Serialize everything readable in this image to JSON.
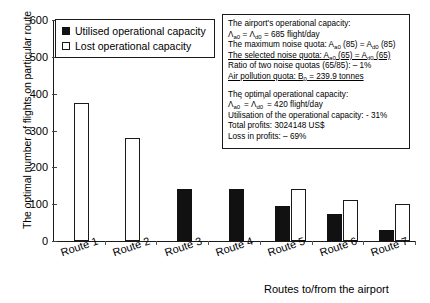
{
  "chart_data": {
    "type": "bar",
    "title": "",
    "xlabel": "Routes to/from the airport",
    "ylabel": "The optimal number of flights on particular route",
    "ylim": [
      0,
      600
    ],
    "yticks": [
      0,
      100,
      200,
      300,
      400,
      500,
      600
    ],
    "grid": false,
    "legend_position": "top-left",
    "categories": [
      "Route 1",
      "Route 2",
      "Route 3",
      "Route 4",
      "Route 5",
      "Route 6",
      "Route 7"
    ],
    "series": [
      {
        "name": "Utilised operational capacity",
        "color": "#111111",
        "values": [
          0,
          0,
          140,
          140,
          95,
          72,
          30
        ]
      },
      {
        "name": "Lost operational capacity",
        "color": "#ffffff",
        "values": [
          375,
          280,
          0,
          0,
          142,
          112,
          100
        ]
      }
    ]
  },
  "legend": {
    "items": [
      {
        "label": "Utilised operational capacity",
        "style": "filled"
      },
      {
        "label": "Lost operational capacity",
        "style": "hollow"
      }
    ]
  },
  "axes": {
    "y_title": "The optimal number of flights on particular route",
    "x_title": "Routes to/from the airport",
    "y_tick_labels": [
      "600",
      "500",
      "400",
      "300",
      "200",
      "100",
      "0"
    ],
    "x_tick_labels": [
      "Route 1",
      "Route 2",
      "Route 3",
      "Route 4",
      "Route 5",
      "Route 6",
      "Route 7"
    ]
  },
  "annotation": {
    "block1": [
      {
        "text": "The airport's operational capacity:",
        "underline": false
      },
      {
        "text": "Λa0 = Λd0 = 685 flight/day",
        "underline": false
      },
      {
        "text": "The maximum noise quota: Aa0 (85) = Ad0 (85)",
        "underline": false
      },
      {
        "text": "The selected noise quota: Aa0 (65) = Ad0 (65)",
        "underline": true
      },
      {
        "text": "Ratio of two noise quotas (65/85): – 1%",
        "underline": false
      },
      {
        "text": "Air pollution quota: B0 = 239.9 tonnes",
        "underline": true
      }
    ],
    "block2": [
      {
        "text": "The optimal operational capacity:",
        "underline": false
      },
      {
        "text": "Λa0' = Λd0' = 420 flight/day",
        "underline": false
      },
      {
        "text": "Utilisation of the operational capacity: - 31%",
        "underline": false
      },
      {
        "text": "Total profits: 3024148 US$",
        "underline": false
      },
      {
        "text": "Loss in profits: – 69%",
        "underline": false
      }
    ]
  }
}
